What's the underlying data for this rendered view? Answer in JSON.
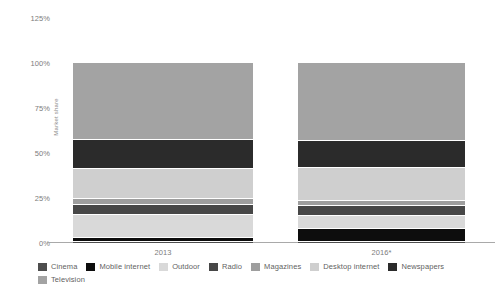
{
  "chart_data": {
    "type": "bar",
    "subtype": "stacked-percentage",
    "title": "",
    "xlabel": "",
    "ylabel": "Market share",
    "categories": [
      "2013",
      "2016*"
    ],
    "ylim": [
      0,
      125
    ],
    "yticks": [
      0,
      25,
      50,
      75,
      100,
      125
    ],
    "ytick_labels": [
      "0%",
      "25%",
      "50%",
      "75%",
      "100%",
      "125%"
    ],
    "grid": false,
    "legend_position": "bottom",
    "stack_order_bottom_to_top": [
      "Cinema",
      "Mobile internet",
      "Outdoor",
      "Radio",
      "Magazines",
      "Desktop internet",
      "Newspapers",
      "Television"
    ],
    "series": [
      {
        "name": "Cinema",
        "color": "#4d4d4d",
        "values": [
          0.5,
          0.5
        ]
      },
      {
        "name": "Mobile internet",
        "color": "#0d0d0d",
        "values": [
          2.5,
          7.5
        ]
      },
      {
        "name": "Outdoor",
        "color": "#d9d9d9",
        "values": [
          12.5,
          7.0
        ]
      },
      {
        "name": "Radio",
        "color": "#474747",
        "values": [
          5.5,
          5.5
        ]
      },
      {
        "name": "Magazines",
        "color": "#9e9e9e",
        "values": [
          3.5,
          3.0
        ]
      },
      {
        "name": "Desktop internet",
        "color": "#cfcfcf",
        "values": [
          16.5,
          18.0
        ]
      },
      {
        "name": "Newspapers",
        "color": "#2b2b2b",
        "values": [
          16.5,
          15.0
        ]
      },
      {
        "name": "Television",
        "color": "#a3a3a3",
        "values": [
          42.5,
          43.5
        ]
      }
    ]
  },
  "legend": {
    "items": [
      {
        "label": "Cinema",
        "color": "#4d4d4d"
      },
      {
        "label": "Mobile internet",
        "color": "#0d0d0d"
      },
      {
        "label": "Outdoor",
        "color": "#d9d9d9"
      },
      {
        "label": "Radio",
        "color": "#474747"
      },
      {
        "label": "Magazines",
        "color": "#9e9e9e"
      },
      {
        "label": "Desktop internet",
        "color": "#cfcfcf"
      },
      {
        "label": "Newspapers",
        "color": "#2b2b2b"
      },
      {
        "label": "Television",
        "color": "#a3a3a3"
      }
    ]
  }
}
